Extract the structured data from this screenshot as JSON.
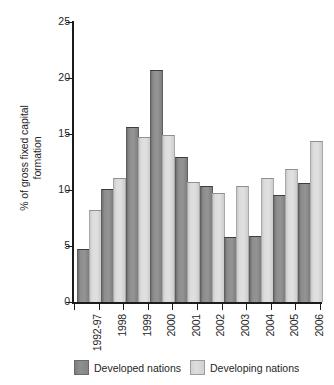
{
  "chart_data": {
    "type": "bar",
    "title": "",
    "xlabel": "",
    "ylabel": "% of gross fixed capital formation",
    "ylabel_lines": [
      "% of gross fixed capital",
      "formation"
    ],
    "ylim": [
      0,
      25
    ],
    "yticks": [
      0,
      5,
      10,
      15,
      20,
      25
    ],
    "ytick_labels": [
      "0",
      "5",
      "10",
      "15",
      "20",
      "25"
    ],
    "grid": false,
    "legend_position": "bottom",
    "categories": [
      "1992-97",
      "1998",
      "1999",
      "2000",
      "2001",
      "2002",
      "2003",
      "2004",
      "2005",
      "2006"
    ],
    "series": [
      {
        "name": "Developed nations",
        "color": "#8d8d8d",
        "values": [
          4.6,
          10.0,
          15.5,
          20.6,
          12.9,
          10.3,
          5.7,
          5.8,
          9.5,
          10.5
        ]
      },
      {
        "name": "Developing nations",
        "color": "#dcdcdc",
        "values": [
          8.1,
          11.0,
          14.6,
          14.8,
          10.6,
          9.6,
          10.3,
          11.0,
          11.8,
          14.3
        ]
      }
    ]
  },
  "legend": {
    "entries": [
      {
        "label": "Developed nations",
        "swatch": "developed"
      },
      {
        "label": "Developing nations",
        "swatch": "developing"
      }
    ]
  }
}
